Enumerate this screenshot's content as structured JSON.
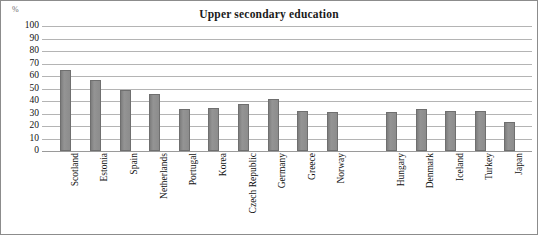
{
  "chart_data": {
    "type": "bar",
    "title": "Upper secondary education",
    "xlabel": "",
    "ylabel": "%",
    "ylim": [
      0,
      100
    ],
    "ytick_step": 10,
    "grid": true,
    "legend": "none",
    "bar_color": "#8d8d8d",
    "bar_border_color": "#6f6f6f",
    "gridline_color": "#b4b4b4",
    "yticks": [
      "100",
      "90",
      "80",
      "70",
      "60",
      "50",
      "40",
      "30",
      "20",
      "10",
      "0"
    ],
    "categories": [
      "Scotland",
      "Estonia",
      "Spain",
      "Netherlands",
      "Portugal",
      "Korea",
      "Czech Republic",
      "Germany",
      "Greece",
      "Norway",
      "Hungary",
      "Denmark",
      "Iceland",
      "Turkey",
      "Japan"
    ],
    "values": [
      65,
      57,
      48.5,
      45.5,
      33.5,
      34.5,
      37.5,
      42,
      32,
      31.5,
      31,
      34,
      32,
      32,
      23
    ],
    "gap_after_index": 9
  },
  "axis": {
    "unit_label": "%"
  }
}
